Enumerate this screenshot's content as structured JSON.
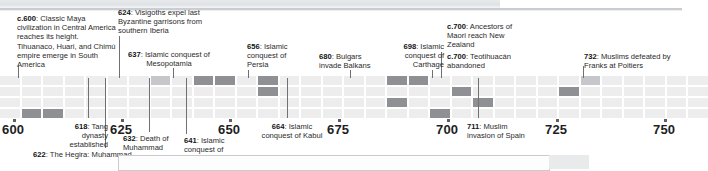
{
  "figure": {
    "type": "historical-timeline",
    "era": "CE",
    "domain_note": "Seventh–eighth century world history timeline strip"
  },
  "axis": {
    "label_suffix": "",
    "range_start": 596,
    "range_end": 755,
    "ticks": [
      {
        "value": 600,
        "label": "600",
        "x": 2
      },
      {
        "value": 625,
        "label": "625",
        "x": 110
      },
      {
        "value": 650,
        "label": "650",
        "x": 218
      },
      {
        "value": 675,
        "label": "675",
        "x": 327
      },
      {
        "value": 700,
        "label": "700",
        "x": 436
      },
      {
        "value": 725,
        "label": "725",
        "x": 545
      },
      {
        "value": 750,
        "label": "750",
        "x": 653
      }
    ]
  },
  "events_above": [
    {
      "year_label": "c.600",
      "text": "Classic Maya civilization in Central America reaches its height. Tihuanaco, Huari, and Chimú empire emerge in South America",
      "x": 17,
      "y": 14,
      "width": 100,
      "align": "left",
      "leader_x": 18,
      "leader_top": 66,
      "leader_height": 12
    },
    {
      "year_label": "624",
      "text": "Visigoths expel last Byzantine garrisons from southern Iberia",
      "x": 118,
      "y": 8,
      "width": 92,
      "align": "left",
      "leader_x": 119,
      "leader_top": 36,
      "leader_height": 42
    },
    {
      "year_label": "637",
      "text": "Islamic conquest of Mesopotamia",
      "x": 124,
      "y": 50,
      "width": 90,
      "align": "center",
      "leader_x": 173,
      "leader_top": 68,
      "leader_height": 10
    },
    {
      "year_label": "656",
      "text": "Islamic conquest of Persia",
      "x": 247,
      "y": 42,
      "width": 50,
      "align": "left",
      "leader_x": 248,
      "leader_top": 70,
      "leader_height": 8
    },
    {
      "year_label": "680",
      "text": "Bulgars invade Balkans",
      "x": 319,
      "y": 52,
      "width": 63,
      "align": "left",
      "leader_x": 350,
      "leader_top": 70,
      "leader_height": 8
    },
    {
      "year_label": "698",
      "text": "Islamic conquest of Carthage",
      "x": 390,
      "y": 42,
      "width": 54,
      "align": "right",
      "leader_x": 432,
      "leader_top": 70,
      "leader_height": 8
    },
    {
      "year_label": "c.700",
      "text": "Ancestors of Maori reach New Zealand",
      "x": 447,
      "y": 22,
      "width": 70,
      "align": "left",
      "leader_x": 441,
      "leader_top": 52,
      "leader_height": 26
    },
    {
      "year_label": "c.700",
      "text": "Teotihuacán abandoned",
      "x": 447,
      "y": 52,
      "width": 95,
      "align": "left",
      "leader_x": 441,
      "leader_top": 52,
      "leader_height": 26
    },
    {
      "year_label": "732",
      "text": "Muslims defeated by Franks at Poitiers",
      "x": 584,
      "y": 52,
      "width": 94,
      "align": "left",
      "leader_x": 583,
      "leader_top": 66,
      "leader_height": 12
    }
  ],
  "events_below": [
    {
      "year_label": "618",
      "text": "Tang dynasty established",
      "x": 55,
      "y": 122,
      "width": 53,
      "align": "right",
      "leader_x": 88,
      "leader_top": 78,
      "leader_height": 40
    },
    {
      "year_label": "622",
      "text": "The Hegira: Muhammad",
      "x": 33,
      "y": 150,
      "width": 160,
      "align": "left",
      "leader_x": 105,
      "leader_top": 78,
      "leader_height": 70
    },
    {
      "year_label": "632",
      "text": "Death of Muhammad",
      "x": 123,
      "y": 134,
      "width": 66,
      "align": "left",
      "leader_x": 149,
      "leader_top": 78,
      "leader_height": 54
    },
    {
      "year_label": "641",
      "text": "Islamic conquest of Egypt",
      "x": 184,
      "y": 136,
      "width": 50,
      "align": "left",
      "leader_x": 186,
      "leader_top": 78,
      "leader_height": 56
    },
    {
      "year_label": "664",
      "text": "Islamic conquest of Kabul",
      "x": 258,
      "y": 122,
      "width": 68,
      "align": "center",
      "leader_x": 287,
      "leader_top": 78,
      "leader_height": 40
    },
    {
      "year_label": "711",
      "text": "Muslim invasion of Spain",
      "x": 467,
      "y": 122,
      "width": 62,
      "align": "left",
      "leader_x": 478,
      "leader_top": 78,
      "leader_height": 40
    }
  ],
  "grid": {
    "rows": 4,
    "row_tops": [
      76,
      87,
      98,
      109
    ],
    "row_height": 9,
    "col_width": 21.5,
    "col_gap": 2,
    "base_color": "#ededee",
    "highlight_color": "#8e9094",
    "mid_color": "#c5c7ca",
    "highlight_cells": [
      {
        "row": 3,
        "col": 1,
        "span": 2,
        "tone": "dark"
      },
      {
        "row": 0,
        "col": 9,
        "span": 2,
        "tone": "dark"
      },
      {
        "row": 0,
        "col": 12,
        "span": 1,
        "tone": "dark"
      },
      {
        "row": 1,
        "col": 12,
        "span": 1,
        "tone": "dark"
      },
      {
        "row": 0,
        "col": 18,
        "span": 2,
        "tone": "dark"
      },
      {
        "row": 1,
        "col": 21,
        "span": 1,
        "tone": "dark"
      },
      {
        "row": 0,
        "col": 7,
        "span": 1,
        "tone": "mid"
      },
      {
        "row": 2,
        "col": 18,
        "span": 1,
        "tone": "dark"
      },
      {
        "row": 3,
        "col": 20,
        "span": 1,
        "tone": "dark"
      },
      {
        "row": 2,
        "col": 22,
        "span": 1,
        "tone": "dark"
      },
      {
        "row": 1,
        "col": 26,
        "span": 1,
        "tone": "dark"
      },
      {
        "row": 0,
        "col": 27,
        "span": 1,
        "tone": "mid"
      }
    ]
  },
  "colors": {
    "text": "#2a2a2a",
    "year_bold": "#141414",
    "leader_line": "#6e7072",
    "tick": "#5d5f63",
    "band_top": "#e8eaec"
  }
}
